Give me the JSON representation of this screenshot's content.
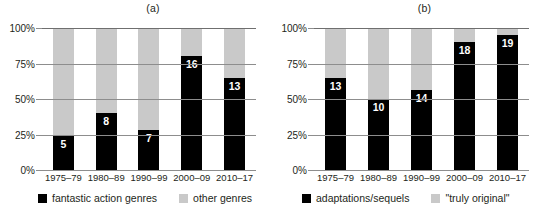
{
  "figure": {
    "panels": [
      {
        "title": "(a)",
        "legend": [
          {
            "label": "fantastic action genres",
            "swatch": "dark",
            "color": "#000000"
          },
          {
            "label": "other genres",
            "swatch": "light",
            "color": "#c9c9c9"
          }
        ]
      },
      {
        "title": "(b)",
        "legend": [
          {
            "label": "adaptations/sequels",
            "swatch": "dark",
            "color": "#000000"
          },
          {
            "label": "\"truly original\"",
            "swatch": "light",
            "color": "#c9c9c9"
          }
        ]
      }
    ]
  },
  "yaxis": {
    "ticks": [
      "100%",
      "75%",
      "50%",
      "25%",
      "0%"
    ],
    "values": [
      100,
      75,
      50,
      25,
      0
    ]
  },
  "chart_data": [
    {
      "type": "bar",
      "title": "(a)",
      "stacked": true,
      "categories": [
        "1975–79",
        "1980–89",
        "1990–99",
        "2000–09",
        "2010–17"
      ],
      "series": [
        {
          "name": "fantastic action genres",
          "color": "#000000",
          "values": [
            24,
            40,
            28,
            80,
            65
          ],
          "labels": [
            "5",
            "8",
            "7",
            "16",
            "13"
          ]
        },
        {
          "name": "other genres",
          "color": "#c9c9c9",
          "values": [
            76,
            60,
            72,
            20,
            35
          ],
          "labels": [
            "",
            "",
            "",
            "",
            ""
          ]
        }
      ],
      "xlabel": "",
      "ylabel": "",
      "ylim": [
        0,
        100
      ],
      "yticks": [
        0,
        25,
        50,
        75,
        100
      ],
      "ytick_labels": [
        "0%",
        "25%",
        "50%",
        "75%",
        "100%"
      ],
      "grid": true,
      "legend_position": "bottom"
    },
    {
      "type": "bar",
      "title": "(b)",
      "stacked": true,
      "categories": [
        "1975–79",
        "1980–89",
        "1990–99",
        "2000–09",
        "2010–17"
      ],
      "series": [
        {
          "name": "adaptations/sequels",
          "color": "#000000",
          "values": [
            65,
            50,
            56,
            90,
            95
          ],
          "labels": [
            "13",
            "10",
            "14",
            "18",
            "19"
          ]
        },
        {
          "name": "\"truly original\"",
          "color": "#c9c9c9",
          "values": [
            35,
            50,
            44,
            10,
            5
          ],
          "labels": [
            "",
            "",
            "",
            "",
            ""
          ]
        }
      ],
      "xlabel": "",
      "ylabel": "",
      "ylim": [
        0,
        100
      ],
      "yticks": [
        0,
        25,
        50,
        75,
        100
      ],
      "ytick_labels": [
        "0%",
        "25%",
        "50%",
        "75%",
        "100%"
      ],
      "grid": true,
      "legend_position": "bottom"
    }
  ]
}
